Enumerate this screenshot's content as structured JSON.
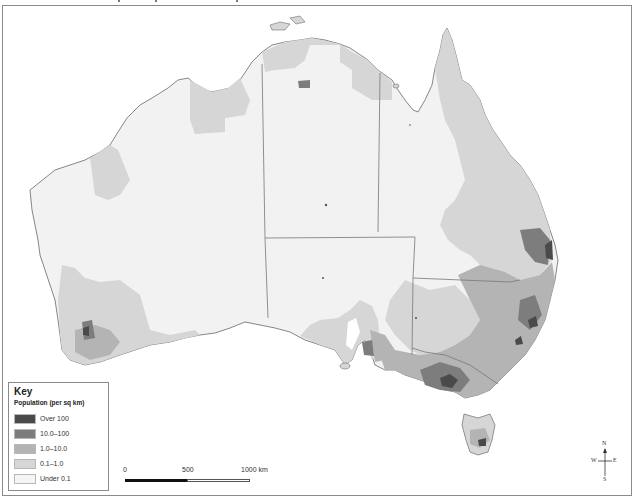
{
  "map": {
    "subject": "Australia population density",
    "colors": {
      "over_100": "#4a4a4a",
      "10_to_100": "#7d7d7d",
      "1_to_10": "#b4b4b4",
      "0_1_to_1": "#d6d6d6",
      "under_0_1": "#f2f2f2",
      "border": "#8a8a8a",
      "water": "#ffffff"
    }
  },
  "key": {
    "title": "Key",
    "subtitle": "Population (per sq km)",
    "items": [
      {
        "label": "Over 100",
        "color": "#4a4a4a"
      },
      {
        "label": "10.0–100",
        "color": "#7d7d7d"
      },
      {
        "label": "1.0–10.0",
        "color": "#b4b4b4"
      },
      {
        "label": "0.1–1.0",
        "color": "#d6d6d6"
      },
      {
        "label": "Under 0.1",
        "color": "#f5f5f5"
      }
    ]
  },
  "scale_bar": {
    "ticks": [
      "0",
      "500",
      "1000 km"
    ]
  },
  "compass": {
    "n": "N",
    "s": "S",
    "e": "E",
    "w": "W"
  }
}
